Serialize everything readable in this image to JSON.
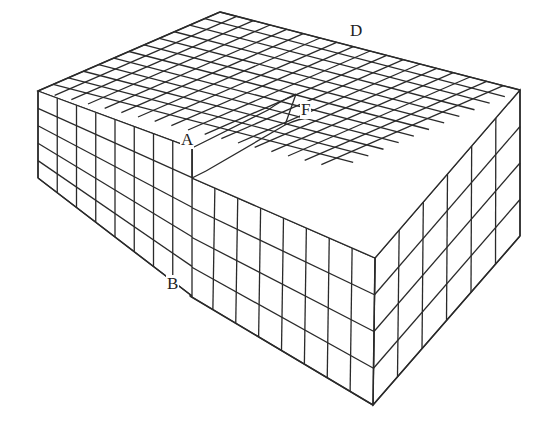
{
  "diagram": {
    "labels": [
      {
        "id": "A",
        "text": "A",
        "x": 180,
        "y": 131
      },
      {
        "id": "B",
        "text": "B",
        "x": 166,
        "y": 275
      },
      {
        "id": "D",
        "text": "D",
        "x": 349,
        "y": 22
      },
      {
        "id": "F",
        "text": "F",
        "x": 300,
        "y": 101
      }
    ],
    "stroke_color": "#2a2a2a",
    "background": "#ffffff",
    "grid": {
      "top_back": [
        220,
        12
      ],
      "top_left": [
        38,
        91
      ],
      "top_right": [
        520,
        90
      ],
      "front_top": [
        375,
        258
      ],
      "front_bottom": [
        373,
        405
      ],
      "left_bottom": [
        38,
        178
      ],
      "raised_corner_top": [
        192,
        148
      ],
      "raised_corner_low": [
        192,
        178
      ],
      "b_bottom": [
        190,
        296
      ],
      "cols_right": 18,
      "cols_left": 14,
      "layers": 4
    }
  }
}
